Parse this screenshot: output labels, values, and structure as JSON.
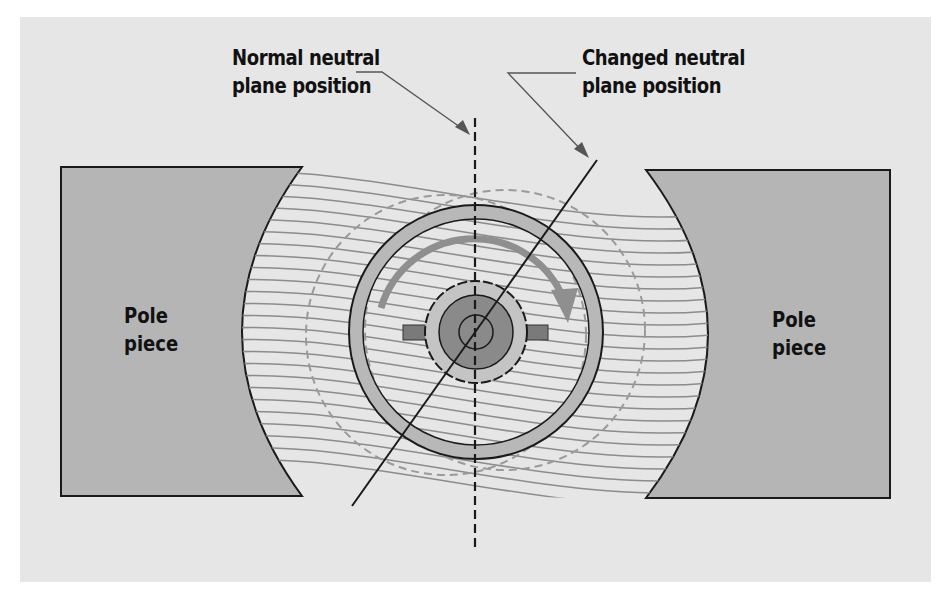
{
  "labels": {
    "normal_plane_line1": "Normal neutral",
    "normal_plane_line2": "plane position",
    "changed_plane_line1": "Changed neutral",
    "changed_plane_line2": "plane position",
    "left_pole_line1": "Pole",
    "left_pole_line2": "piece",
    "right_pole_line1": "Pole",
    "right_pole_line2": "piece"
  },
  "colors": {
    "panel_background": "#e6e6e6",
    "pole_fill": "#b5b5b5",
    "field_lines": "#8c8c8c",
    "armature_ring": "#b8b8b8",
    "rotation_arrow": "#8f8f8f",
    "commutator_core": "#8a8a8a",
    "outline": "#1a1a1a"
  },
  "elements": {
    "normal_neutral_plane": "vertical-dashed-line",
    "changed_neutral_plane": "tilted-solid-line",
    "rotation_direction": "clockwise-arrow"
  }
}
